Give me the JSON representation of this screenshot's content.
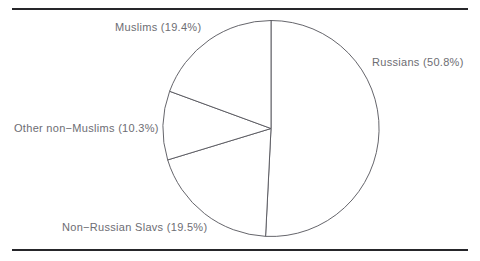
{
  "figure": {
    "background_color": "#ffffff",
    "rule_color": "#26262a",
    "outline_color": "#53535a",
    "label_color": "#6d6d73",
    "top_rule_name": "top-divider-rule",
    "bottom_rule_name": "bottom-divider-rule"
  },
  "chart_data": {
    "type": "pie",
    "title": "",
    "subtitle": "",
    "xlabel": "",
    "ylabel": "",
    "grid": false,
    "legend_position": "none",
    "label_format": "{name} ({value}%)",
    "start_angle_deg": 90,
    "direction": "clockwise",
    "center": {
      "x": 271,
      "y": 128.5
    },
    "radius": 108,
    "categories": [
      "Russians",
      "Non-Russian Slavs",
      "Other non-Muslims",
      "Muslims"
    ],
    "values": [
      50.8,
      19.5,
      10.3,
      19.4
    ],
    "total": 100.0,
    "slices": [
      {
        "name": "Russians",
        "value": 50.8,
        "label": "Russians (50.8%)",
        "start_deg": 90,
        "end_deg": -92.88,
        "fill": "#ffffff",
        "stroke": "#53535a"
      },
      {
        "name": "Non-Russian Slavs",
        "value": 19.5,
        "label": "Non−Russian Slavs (19.5%)",
        "start_deg": -92.88,
        "end_deg": -163.08,
        "fill": "#ffffff",
        "stroke": "#53535a"
      },
      {
        "name": "Other non-Muslims",
        "value": 10.3,
        "label": "Other non−Muslims (10.3%)",
        "start_deg": -163.08,
        "end_deg": -200.16,
        "fill": "#ffffff",
        "stroke": "#53535a"
      },
      {
        "name": "Muslims",
        "value": 19.4,
        "label": "Muslims (19.4%)",
        "start_deg": -200.16,
        "end_deg": -270.0,
        "fill": "#ffffff",
        "stroke": "#53535a"
      }
    ]
  },
  "labels": {
    "muslims": "Muslims (19.4%)",
    "russians": "Russians (50.8%)",
    "other_non_muslims": "Other non−Muslims (10.3%)",
    "non_russian_slavs": "Non−Russian Slavs (19.5%)"
  }
}
